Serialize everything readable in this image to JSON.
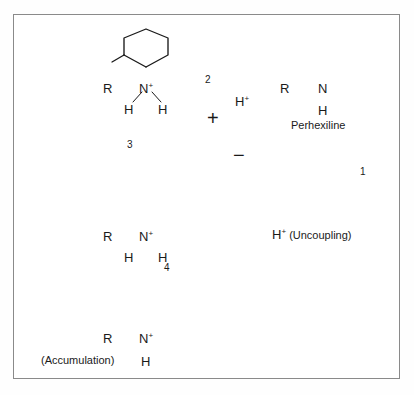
{
  "diagram": {
    "title_visible": false,
    "frame": {
      "border_color": "#8a8a8a",
      "background": "#ffffff"
    },
    "colors": {
      "ink": "#1a1a1a",
      "membrane": "#111111",
      "frame": "#8a8a8a"
    },
    "membrane": {
      "name": "mitochondrial-membrane",
      "outer_charge_label": "+",
      "inner_charge_label": "−"
    },
    "steps": [
      {
        "id": "1",
        "label": "1",
        "x": 363,
        "y": 172
      },
      {
        "id": "2",
        "label": "2",
        "x": 208,
        "y": 80
      },
      {
        "id": "3",
        "label": "3",
        "x": 130,
        "y": 145
      },
      {
        "id": "4",
        "label": "4",
        "x": 167,
        "y": 268
      }
    ],
    "molecules": [
      {
        "name": "protonated-perhexiline-outside",
        "r_label": "R",
        "n_label": "N",
        "n_charge": "+",
        "h_left": "H",
        "h_right": "H",
        "caption": ""
      },
      {
        "name": "neutral-perhexiline",
        "r_label": "R",
        "n_label": "N",
        "n_charge": "",
        "h_below": "H",
        "caption": "Perhexiline"
      },
      {
        "name": "protonated-perhexiline-inside",
        "r_label": "R",
        "n_label": "N",
        "n_charge": "+",
        "h_left": "H",
        "h_right": "H",
        "caption": ""
      },
      {
        "name": "accumulated-perhexiline",
        "r_label": "R",
        "n_label": "N",
        "n_charge": "+",
        "h_below": "H",
        "caption": "(Accumulation)"
      }
    ],
    "annotations": {
      "proton_released": "H",
      "proton_released_charge": "+",
      "uncoupling": "H",
      "uncoupling_charge": "+",
      "uncoupling_text": "(Uncoupling)",
      "accumulation_text": "(Accumulation)",
      "perhexiline_text": "Perhexiline"
    }
  }
}
